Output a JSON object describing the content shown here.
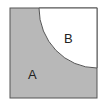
{
  "diagram": {
    "shape": "square with quarter-circle cut from top-right corner",
    "regions": [
      {
        "label": "A",
        "fill": "#b8b8b8",
        "description": "shaded region outside quarter circle"
      },
      {
        "label": "B",
        "fill": "#ffffff",
        "description": "quarter circle region at top-right corner"
      }
    ],
    "colors": {
      "outline": "#555555",
      "shade": "#b8b8b8",
      "background": "#ffffff"
    }
  }
}
